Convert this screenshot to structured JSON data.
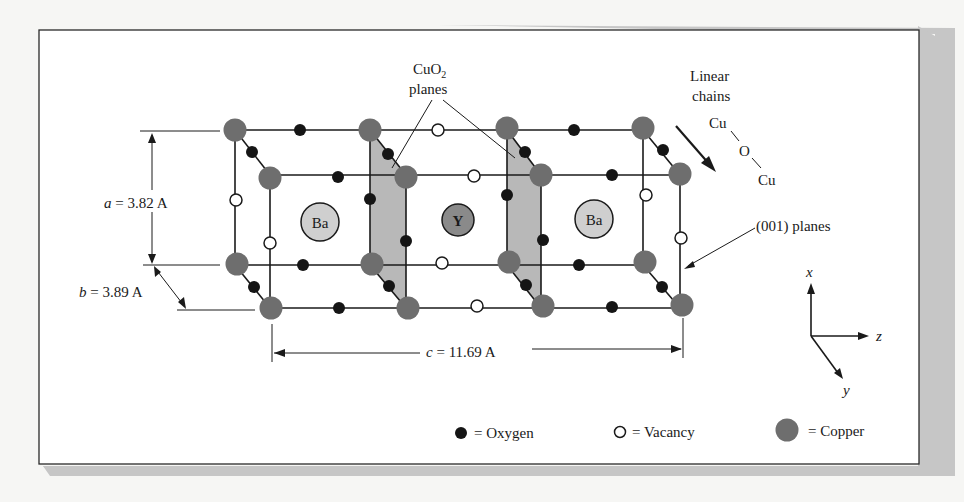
{
  "figure": {
    "labels": {
      "cuo2_line1": "CuO",
      "cuo2_sub": "2",
      "cuo2_line2": "planes",
      "linear_line1": "Linear",
      "linear_line2": "chains",
      "chain_cu_top": "Cu",
      "chain_o": "O",
      "chain_cu_bottom": "Cu",
      "plane001": "(001) planes",
      "a_dim_var": "a",
      "a_dim_val": " = 3.82 A",
      "b_dim_var": "b",
      "b_dim_val": " = 3.89 A",
      "c_dim_var": "c",
      "c_dim_val": " = 11.69 A",
      "ba_left": "Ba",
      "y_center": "Y",
      "ba_right": "Ba"
    },
    "axes": {
      "x": "x",
      "y": "y",
      "z": "z"
    },
    "legend": {
      "oxygen": "= Oxygen",
      "vacancy": "= Vacancy",
      "copper": "= Copper"
    },
    "colors": {
      "copper": "#6e6e6e",
      "oxygen": "#151515",
      "vacancy": "#ffffff",
      "ba": "#cfcfcf",
      "y": "#8a8a8a",
      "plane": "#b8b8b8",
      "shadow": "#c4c4c4",
      "frame": "#2a2a2a"
    }
  }
}
